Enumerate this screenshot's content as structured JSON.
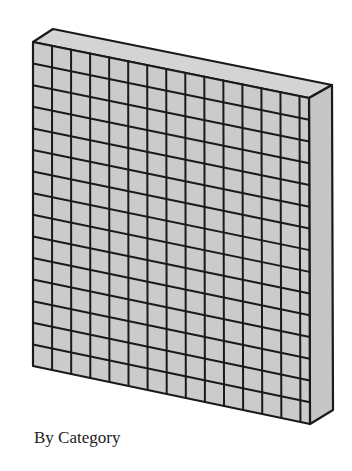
{
  "diagram": {
    "type": "3d-grid-slab",
    "caption": "By Category",
    "grid": {
      "rows": 15,
      "columns": 15,
      "last_column_fraction": 0.5
    },
    "geometry": {
      "front_top_left": [
        33,
        42
      ],
      "front_top_right": [
        309,
        98
      ],
      "front_bottom_left": [
        33,
        366
      ],
      "front_bottom_right": [
        310,
        424
      ],
      "back_top_left": [
        53,
        29
      ],
      "back_top_right": [
        332,
        85
      ],
      "back_bottom_right": [
        333,
        410
      ]
    },
    "colors": {
      "fill": "#cbcbcb",
      "top_face": "#d4d4d4",
      "side_face": "#c6c6c6",
      "stroke": "#1a1a1a",
      "caption": "#222222"
    }
  }
}
